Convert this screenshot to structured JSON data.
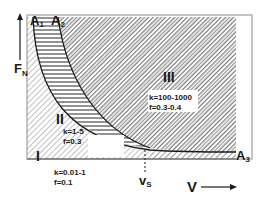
{
  "diagram": {
    "type": "regime-map",
    "axes": {
      "y_label": "F",
      "y_label_sub": "N",
      "x_label": "V",
      "x_marker": "v",
      "x_marker_sub": "S"
    },
    "curves": [
      {
        "name": "A",
        "sub": "1"
      },
      {
        "name": "A",
        "sub": "2"
      },
      {
        "name": "A",
        "sub": "3"
      }
    ],
    "regions": [
      {
        "id": "I",
        "label": "I",
        "k": "k=0.01-1",
        "f": "f=0.1"
      },
      {
        "id": "II",
        "label": "II",
        "k": "k=1-5",
        "f": "f=0.3"
      },
      {
        "id": "III",
        "label": "III",
        "k": "k=100-1000",
        "f": "f=0.3-0.4"
      }
    ],
    "colors": {
      "ink": "#1a1a1a",
      "frame": "#a0a0a0",
      "hatch_light": "#8c8c8c",
      "hatch_dense": "#4a4a4a"
    }
  }
}
